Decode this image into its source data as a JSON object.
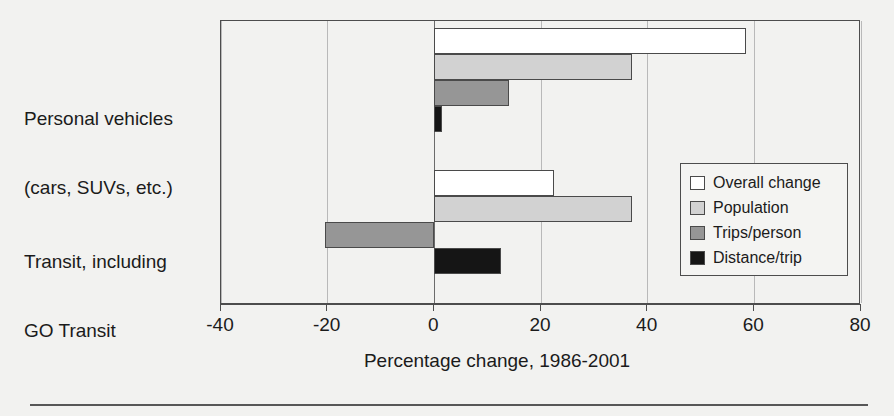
{
  "chart_data": {
    "type": "bar",
    "orientation": "horizontal",
    "title": "",
    "xlabel": "Percentage change, 1986-2001",
    "ylabel": "",
    "xlim": [
      -40,
      80
    ],
    "xticks": [
      -40,
      -20,
      0,
      20,
      40,
      60,
      80
    ],
    "xtick_labels": [
      "-40",
      "-20",
      "0",
      "20",
      "40",
      "60",
      "80"
    ],
    "grid": true,
    "legend_position": "right-middle",
    "categories": [
      "Personal vehicles\n(cars, SUVs, etc.)",
      "Transit, including\nGO Transit"
    ],
    "category_lines": [
      [
        "Personal vehicles",
        "(cars, SUVs, etc.)"
      ],
      [
        "Transit, including",
        "GO Transit"
      ]
    ],
    "series": [
      {
        "name": "Overall change",
        "color": "#ffffff",
        "values": [
          58.5,
          22.5
        ]
      },
      {
        "name": "Population",
        "color": "#d2d2d2",
        "values": [
          37.0,
          37.0
        ]
      },
      {
        "name": "Trips/person",
        "color": "#969696",
        "values": [
          14.0,
          -20.5
        ]
      },
      {
        "name": "Distance/trip",
        "color": "#151515",
        "values": [
          1.5,
          12.5
        ]
      }
    ]
  },
  "legend": {
    "items": [
      {
        "label": "Overall change",
        "swatch": "sw-overall"
      },
      {
        "label": "Population",
        "swatch": "sw-pop"
      },
      {
        "label": "Trips/person",
        "swatch": "sw-trips"
      },
      {
        "label": "Distance/trip",
        "swatch": "sw-dist"
      }
    ]
  }
}
